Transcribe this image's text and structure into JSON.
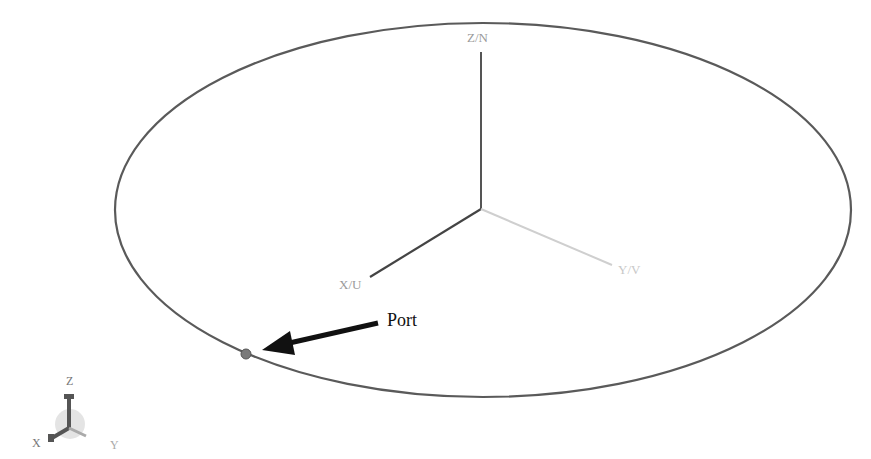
{
  "diagram": {
    "type": "3d-antenna-loop-view",
    "axes": {
      "z_label": "Z/N",
      "x_label": "X/U",
      "y_label": "Y/V"
    },
    "annotation": {
      "label": "Port"
    },
    "triad": {
      "z_label": "Z",
      "x_label": "X",
      "y_label": "Y"
    },
    "colors": {
      "background": "#ffffff",
      "loop": "#555555",
      "z_axis": "#555555",
      "x_axis": "#444444",
      "y_axis": "#c8c8c8",
      "arrow": "#111111",
      "port_marker": "#7a7a7a"
    }
  }
}
